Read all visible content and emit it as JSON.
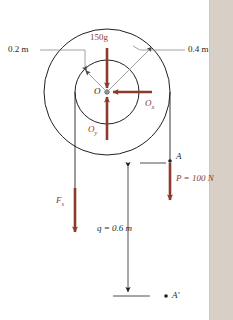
{
  "figure": {
    "type": "free-body-diagram",
    "background_color": "#ffffff",
    "sidebar_color": "#d8cfc7",
    "force_color": "#8c3a2b",
    "line_color": "#231f20"
  },
  "labels": {
    "inner_radius": "0.2 m",
    "outer_radius": "0.4 m",
    "weight": "150g",
    "reaction_x": "O",
    "reaction_x_sub": "x",
    "reaction_y": "O",
    "reaction_y_sub": "y",
    "center": "O",
    "spring_force": "F",
    "spring_force_sub": "s",
    "distance": "q  = 0.6 m",
    "point_a": "A",
    "applied_force": "P  = 100 N",
    "point_a_prime": "A′"
  },
  "geometry": {
    "center_x": 107,
    "center_y": 92,
    "inner_radius_px": 32,
    "outer_radius_px": 63,
    "left_cord_x": 75,
    "right_cord_x": 170,
    "dimension_line_x": 128,
    "dimension_top_y": 163,
    "dimension_bottom_y": 296
  },
  "values": {
    "mass_times_g": "150g",
    "inner_radius_m": 0.2,
    "outer_radius_m": 0.4,
    "applied_load_N": 100,
    "travel_distance_m": 0.6
  }
}
